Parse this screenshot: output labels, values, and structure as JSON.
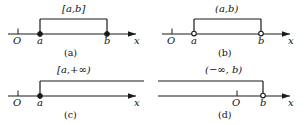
{
  "figure": {
    "background": "#ffffff",
    "ink": "#1a1a1a",
    "panels": [
      {
        "id": "a",
        "caption": "(a)",
        "interval_label": "[a,b]",
        "interval_type": "closed",
        "origin_label": "O",
        "axis_label": "x",
        "left_point_label": "a",
        "right_point_label": "b",
        "left_endpoint": "closed",
        "right_endpoint": "closed",
        "direction": "bounded"
      },
      {
        "id": "b",
        "caption": "(b)",
        "interval_label": "(a,b)",
        "interval_type": "open",
        "origin_label": "O",
        "axis_label": "x",
        "left_point_label": "a",
        "right_point_label": "b",
        "left_endpoint": "open",
        "right_endpoint": "open",
        "direction": "bounded"
      },
      {
        "id": "c",
        "caption": "(c)",
        "interval_label": "[a,+∞)",
        "interval_type": "half-open-right-infinite",
        "origin_label": "O",
        "axis_label": "x",
        "left_point_label": "a",
        "right_point_label": "",
        "left_endpoint": "closed",
        "right_endpoint": "none",
        "direction": "right-infinite"
      },
      {
        "id": "d",
        "caption": "(d)",
        "interval_label": "(−∞, b)",
        "interval_type": "half-open-left-infinite",
        "origin_label": "O",
        "axis_label": "x",
        "left_point_label": "",
        "right_point_label": "b",
        "left_endpoint": "none",
        "right_endpoint": "open",
        "direction": "left-infinite"
      }
    ]
  }
}
